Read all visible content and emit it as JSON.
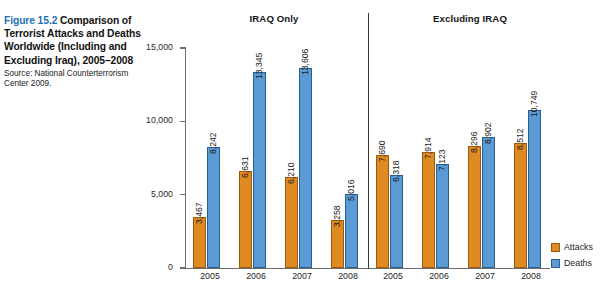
{
  "caption": {
    "figure_number": "Figure 15.2",
    "title": " Comparison of Terrorist Attacks and Deaths Worldwide (Including and Excluding Iraq), 2005–2008",
    "source": "Source: National Counterterrorism Center 2009."
  },
  "panels": {
    "left_header": "IRAQ Only",
    "right_header": "Excluding IRAQ"
  },
  "legend": {
    "position": "bottom-right",
    "items": [
      {
        "label": "Attacks",
        "color": "#e08a22"
      },
      {
        "label": "Deaths",
        "color": "#5b9bd5"
      }
    ]
  },
  "chart_data": {
    "type": "bar",
    "title": "Comparison of Terrorist Attacks and Deaths Worldwide (Including and Excluding Iraq), 2005–2008",
    "xlabel": "",
    "ylabel": "",
    "ylim": [
      0,
      15000
    ],
    "yticks": [
      0,
      5000,
      10000,
      15000
    ],
    "ytick_labels": [
      "0",
      "5,000",
      "10,000",
      "15,000"
    ],
    "grid": false,
    "panels": [
      {
        "name": "IRAQ Only",
        "categories": [
          "2005",
          "2006",
          "2007",
          "2008"
        ],
        "series": [
          {
            "name": "Attacks",
            "color": "#e08a22",
            "values": [
              3467,
              6631,
              6210,
              3258
            ],
            "labels": [
              "3,467",
              "6,631",
              "6,210",
              "3,258"
            ]
          },
          {
            "name": "Deaths",
            "color": "#5b9bd5",
            "values": [
              8242,
              13345,
              13606,
              5016
            ],
            "labels": [
              "8,242",
              "13,345",
              "13,606",
              "5,016"
            ]
          }
        ]
      },
      {
        "name": "Excluding IRAQ",
        "categories": [
          "2005",
          "2006",
          "2007",
          "2008"
        ],
        "series": [
          {
            "name": "Attacks",
            "color": "#e08a22",
            "values": [
              7690,
              7914,
              8296,
              8512
            ],
            "labels": [
              "7,690",
              "7,914",
              "8,296",
              "8,512"
            ]
          },
          {
            "name": "Deaths",
            "color": "#5b9bd5",
            "values": [
              6318,
              7123,
              8902,
              10749
            ],
            "labels": [
              "6,318",
              "7,123",
              "8,902",
              "10,749"
            ]
          }
        ]
      }
    ]
  }
}
